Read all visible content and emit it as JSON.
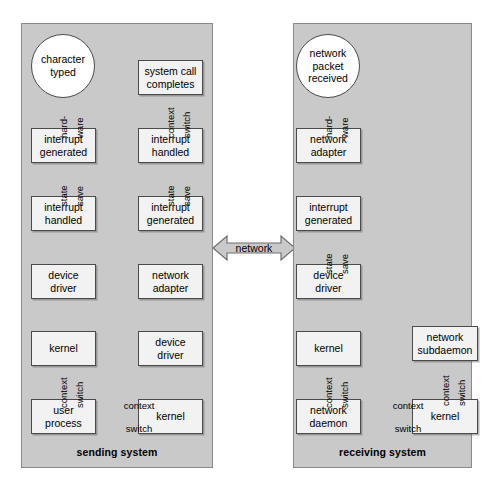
{
  "diagram": {
    "title_absent": true,
    "panels": [
      {
        "id": "sending",
        "label": "sending system",
        "nodes": [
          {
            "id": "s-char-typed",
            "text": "character\ntyped",
            "shape": "circle",
            "x": 31,
            "y": 34,
            "w": 64,
            "h": 64
          },
          {
            "id": "s-int-generated",
            "text": "interrupt\ngenerated",
            "shape": "box",
            "x": 31,
            "y": 128,
            "w": 65,
            "h": 35
          },
          {
            "id": "s-int-handled",
            "text": "interrupt\nhandled",
            "shape": "box",
            "x": 31,
            "y": 196,
            "w": 65,
            "h": 35
          },
          {
            "id": "s-device-driver",
            "text": "device\ndriver",
            "shape": "box",
            "x": 31,
            "y": 264,
            "w": 65,
            "h": 35
          },
          {
            "id": "s-kernel-left",
            "text": "kernel",
            "shape": "box",
            "x": 31,
            "y": 331,
            "w": 65,
            "h": 35
          },
          {
            "id": "s-user-process",
            "text": "user\nprocess",
            "shape": "box",
            "x": 31,
            "y": 399,
            "w": 65,
            "h": 35
          },
          {
            "id": "s-kernel-right",
            "text": "kernel",
            "shape": "box",
            "x": 138,
            "y": 399,
            "w": 65,
            "h": 35
          },
          {
            "id": "s-device-driver-2",
            "text": "device\ndriver",
            "shape": "box",
            "x": 138,
            "y": 331,
            "w": 65,
            "h": 35
          },
          {
            "id": "s-network-adapter",
            "text": "network\nadapter",
            "shape": "box",
            "x": 138,
            "y": 264,
            "w": 65,
            "h": 35
          },
          {
            "id": "s-int-generated-2",
            "text": "interrupt\ngenerated",
            "shape": "box",
            "x": 138,
            "y": 196,
            "w": 65,
            "h": 35
          },
          {
            "id": "s-int-handled-2",
            "text": "interrupt\nhandled",
            "shape": "box",
            "x": 138,
            "y": 128,
            "w": 65,
            "h": 35
          },
          {
            "id": "s-syscall",
            "text": "system call\ncompletes",
            "shape": "box",
            "x": 138,
            "y": 60,
            "w": 65,
            "h": 35
          }
        ],
        "edge_labels": [
          {
            "id": "s-hardware",
            "left": "hard-",
            "right": "ware",
            "x": 63,
            "y": 112
          },
          {
            "id": "s-statesave",
            "left": "state",
            "right": "save",
            "x": 63,
            "y": 180
          },
          {
            "id": "s-ctxswitch",
            "left": "context",
            "right": "switch",
            "x": 63,
            "y": 382
          },
          {
            "id": "s-ctxswitch-2",
            "left": "context",
            "right": "switch",
            "x": 170,
            "y": 112
          },
          {
            "id": "s-statesave-2",
            "left": "state",
            "right": "save",
            "x": 170,
            "y": 180
          }
        ],
        "horizontal_labels": [
          {
            "id": "s-ctx-switch-h",
            "line1": "context",
            "line2": "switch",
            "x": 117,
            "y": 416
          }
        ]
      },
      {
        "id": "receiving",
        "label": "receiving system",
        "nodes": [
          {
            "id": "r-packet",
            "text": "network\npacket\nreceived",
            "shape": "circle",
            "x": 296,
            "y": 34,
            "w": 64,
            "h": 64
          },
          {
            "id": "r-network-adapter",
            "text": "network\nadapter",
            "shape": "box",
            "x": 296,
            "y": 128,
            "w": 65,
            "h": 35
          },
          {
            "id": "r-int-generated",
            "text": "interrupt\ngenerated",
            "shape": "box",
            "x": 296,
            "y": 196,
            "w": 65,
            "h": 35
          },
          {
            "id": "r-device-driver",
            "text": "device\ndriver",
            "shape": "box",
            "x": 296,
            "y": 264,
            "w": 65,
            "h": 35
          },
          {
            "id": "r-kernel",
            "text": "kernel",
            "shape": "box",
            "x": 296,
            "y": 331,
            "w": 65,
            "h": 35
          },
          {
            "id": "r-network-daemon",
            "text": "network\ndaemon",
            "shape": "box",
            "x": 296,
            "y": 399,
            "w": 65,
            "h": 35
          },
          {
            "id": "r-kernel-2",
            "text": "kernel",
            "shape": "box",
            "x": 412,
            "y": 399,
            "w": 66,
            "h": 35
          },
          {
            "id": "r-subdaemon",
            "text": "network\nsubdaemon",
            "shape": "box",
            "x": 412,
            "y": 326,
            "w": 66,
            "h": 35
          }
        ],
        "edge_labels": [
          {
            "id": "r-hardware",
            "left": "hard-",
            "right": "ware",
            "x": 328,
            "y": 112
          },
          {
            "id": "r-statesave",
            "left": "state",
            "right": "save",
            "x": 328,
            "y": 248
          },
          {
            "id": "r-ctxswitch",
            "left": "context",
            "right": "switch",
            "x": 328,
            "y": 382
          },
          {
            "id": "r-ctxswitch-2",
            "left": "context",
            "right": "switch",
            "x": 445,
            "y": 380
          }
        ],
        "horizontal_labels": [
          {
            "id": "r-ctx-switch-h",
            "line1": "context",
            "line2": "switch",
            "x": 386,
            "y": 416
          }
        ]
      }
    ],
    "network_link": {
      "label": "network",
      "direction": "bidirectional"
    },
    "colors": {
      "panel_fill": "#c9c9c9",
      "panel_border": "#8a8a8a",
      "node_fill": "#f2f2f2",
      "node_border": "#4a4a4a",
      "circle_fill": "#ffffff",
      "arrow": "#111111",
      "network_arrow_fill": "#c9c9c9",
      "text": "#000000",
      "page_background": "#ffffff"
    }
  }
}
